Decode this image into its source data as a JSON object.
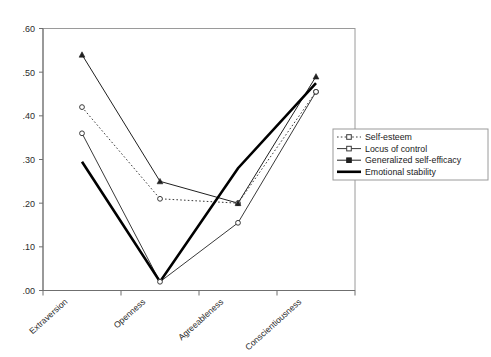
{
  "chart_data": {
    "type": "line",
    "title": "",
    "xlabel": "",
    "ylabel": "",
    "categories": [
      "Extraversion",
      "Openness",
      "Agreeableness",
      "Conscientiousness"
    ],
    "ylim": [
      0.0,
      0.6
    ],
    "yticks": [
      ".00",
      ".10",
      ".20",
      ".30",
      ".40",
      ".50",
      ".60"
    ],
    "ytick_values": [
      0.0,
      0.1,
      0.2,
      0.3,
      0.4,
      0.5,
      0.6
    ],
    "grid": false,
    "legend_position": "right",
    "series": [
      {
        "name": "Self-esteem",
        "values": [
          0.42,
          0.21,
          0.2,
          0.455
        ],
        "line_style": "dotted",
        "marker": "open-circle",
        "line_width": 1,
        "color": "#3a3a3a"
      },
      {
        "name": "Locus of control",
        "values": [
          0.36,
          0.02,
          0.155,
          0.455
        ],
        "line_style": "solid",
        "marker": "open-circle",
        "line_width": 1,
        "color": "#3a3a3a"
      },
      {
        "name": "Generalized self-efficacy",
        "values": [
          0.54,
          0.25,
          0.2,
          0.49
        ],
        "line_style": "solid",
        "marker": "filled-triangle",
        "line_width": 1,
        "color": "#202020"
      },
      {
        "name": "Emotional stability",
        "values": [
          0.295,
          0.02,
          0.28,
          0.475
        ],
        "line_style": "solid",
        "marker": "none",
        "line_width": 2.6,
        "color": "#000000"
      }
    ]
  },
  "legend": {
    "entries": [
      {
        "label": "Self-esteem"
      },
      {
        "label": "Locus of control"
      },
      {
        "label": "Generalized self-efficacy"
      },
      {
        "label": "Emotional stability"
      }
    ]
  },
  "colors": {
    "frame": "#9a9a9a",
    "axis": "#6f6f6f",
    "text": "#2b2b2b",
    "background": "#ffffff"
  }
}
